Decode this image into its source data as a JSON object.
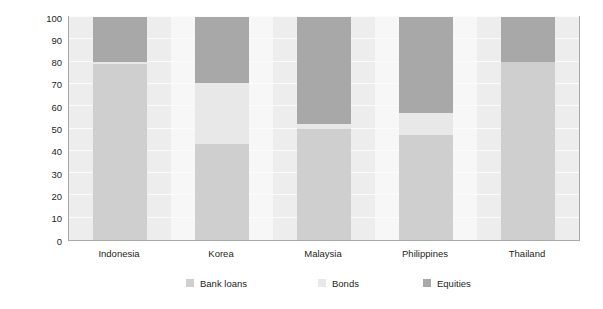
{
  "chart_data": {
    "type": "bar",
    "subtype": "stacked-bar",
    "title": "",
    "xlabel": "",
    "ylabel": "Percent Share",
    "ylim": [
      0,
      100
    ],
    "yticks": [
      0,
      10,
      20,
      30,
      40,
      50,
      60,
      70,
      80,
      90,
      100
    ],
    "grid": true,
    "legend_position": "bottom",
    "categories": [
      "Indonesia",
      "Korea",
      "Malaysia",
      "Philippines",
      "Thailand"
    ],
    "series": [
      {
        "name": "Bank loans",
        "color": "#cfcfcf",
        "values": [
          79,
          43,
          50,
          47,
          80
        ]
      },
      {
        "name": "Bonds",
        "color": "#e8e8e8",
        "values": [
          1,
          27.5,
          2,
          10,
          0
        ]
      },
      {
        "name": "Equities",
        "color": "#a8a8a8",
        "values": [
          20,
          29.5,
          48,
          43,
          20
        ]
      }
    ]
  },
  "axis": {
    "y_title": "Percent Share",
    "y_tick_labels": [
      "100",
      "90",
      "80",
      "70",
      "60",
      "50",
      "40",
      "30",
      "20",
      "10",
      "0"
    ],
    "x_tick_labels": [
      "Indonesia",
      "Korea",
      "Malaysia",
      "Philippines",
      "Thailand"
    ]
  },
  "legend": {
    "items": [
      {
        "label": "Bank loans",
        "color": "#cfcfcf"
      },
      {
        "label": "Bonds",
        "color": "#e8e8e8"
      },
      {
        "label": "Equities",
        "color": "#a8a8a8"
      }
    ]
  },
  "colors": {
    "plot_background": "#f2f2f2",
    "frame": "#a9a9a9",
    "text": "#231f20",
    "bank_loans": "#cfcfcf",
    "bonds": "#e8e8e8",
    "equities": "#a8a8a8"
  }
}
